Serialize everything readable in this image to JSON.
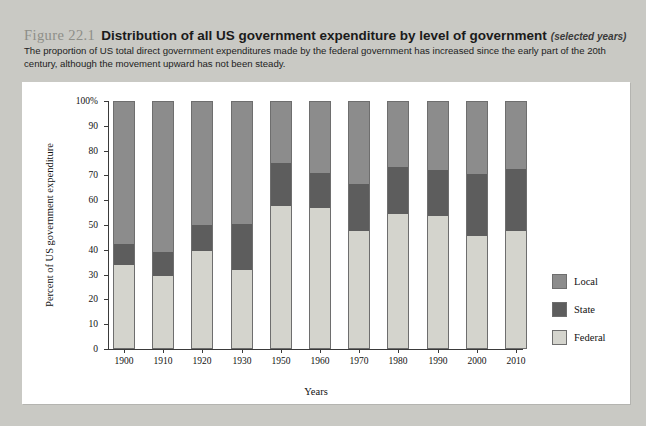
{
  "figure": {
    "number": "Figure 22.1",
    "title": "Distribution of all US government expenditure by level of government",
    "subtitle": "(selected years)",
    "caption": "The proportion of US total direct government expenditures made by the federal government has increased since the early part of the 20th century, although the movement upward has not been steady."
  },
  "colors": {
    "local": "#8c8c8c",
    "state": "#5d5d5d",
    "federal": "#d4d4cd",
    "panel": "#ffffff",
    "page": "#c9c9c4",
    "axis": "#3a3a3a"
  },
  "legend": {
    "items": [
      {
        "label": "Local",
        "color": "#8c8c8c"
      },
      {
        "label": "State",
        "color": "#5d5d5d"
      },
      {
        "label": "Federal",
        "color": "#d4d4cd"
      }
    ]
  },
  "chart_data": {
    "type": "bar",
    "stacked": true,
    "title": "Distribution of all US government expenditure by level of government",
    "xlabel": "Years",
    "ylabel": "Percent of US government expenditure",
    "ylim": [
      0,
      100
    ],
    "yticks": [
      0,
      10,
      20,
      30,
      40,
      50,
      60,
      70,
      80,
      90,
      100
    ],
    "ytick_labels": [
      "0",
      "10",
      "20",
      "30",
      "40",
      "50",
      "60",
      "70",
      "80",
      "90",
      "100%"
    ],
    "grid": false,
    "legend_position": "right",
    "categories": [
      "1900",
      "1910",
      "1920",
      "1930",
      "1950",
      "1960",
      "1970",
      "1980",
      "1990",
      "2000",
      "2010"
    ],
    "series": [
      {
        "name": "Federal",
        "color": "#d4d4cd",
        "values": [
          34,
          29.5,
          39.5,
          32,
          57.5,
          57,
          47.5,
          54.5,
          53.5,
          45.5,
          47.5
        ]
      },
      {
        "name": "State",
        "color": "#5d5d5d",
        "values": [
          8.5,
          9.5,
          10.5,
          18.5,
          17.5,
          14,
          19,
          19,
          18.5,
          25,
          25
        ]
      },
      {
        "name": "Local",
        "color": "#8c8c8c",
        "values": [
          57.5,
          61,
          50,
          49.5,
          25,
          29,
          33.5,
          26.5,
          28,
          29.5,
          27.5
        ]
      }
    ],
    "cumulative_tops": {
      "federal": [
        34,
        29.5,
        39.5,
        32,
        57.5,
        57,
        47.5,
        54.5,
        53.5,
        45.5,
        47.5
      ],
      "federal_plus_state": [
        42.5,
        39,
        50,
        50.5,
        75,
        71,
        66.5,
        73.5,
        72,
        70.5,
        72.5
      ]
    }
  }
}
